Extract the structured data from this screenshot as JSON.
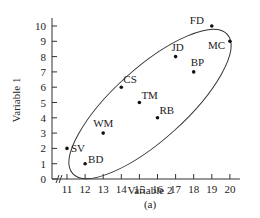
{
  "chart_data": {
    "type": "scatter",
    "title": "",
    "xlabel": "Variable 2",
    "ylabel": "Variable 1",
    "caption": "(a)",
    "xlim": [
      10.3,
      20.8
    ],
    "ylim": [
      0,
      10
    ],
    "x_ticks": [
      11,
      12,
      13,
      14,
      15,
      16,
      17,
      18,
      19,
      20
    ],
    "y_ticks": [
      0,
      1,
      2,
      3,
      4,
      5,
      6,
      7,
      8,
      9,
      10
    ],
    "axis_break": true,
    "grid": false,
    "legend": null,
    "points": [
      {
        "label": "SV",
        "x": 11,
        "y": 2
      },
      {
        "label": "BD",
        "x": 12,
        "y": 1
      },
      {
        "label": "WM",
        "x": 13,
        "y": 3
      },
      {
        "label": "CS",
        "x": 14,
        "y": 6
      },
      {
        "label": "TM",
        "x": 15,
        "y": 5
      },
      {
        "label": "RB",
        "x": 16,
        "y": 4
      },
      {
        "label": "JD",
        "x": 17,
        "y": 8
      },
      {
        "label": "BP",
        "x": 18,
        "y": 7
      },
      {
        "label": "FD",
        "x": 19,
        "y": 10
      },
      {
        "label": "MC",
        "x": 20,
        "y": 9
      }
    ],
    "annotations": [
      "ellipse enclosing all points"
    ]
  }
}
